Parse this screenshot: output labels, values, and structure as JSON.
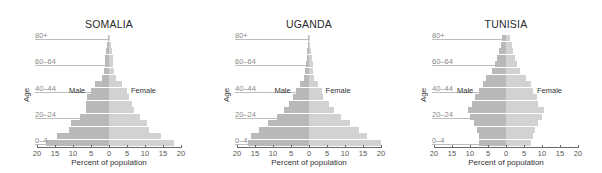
{
  "chart_data": [
    {
      "type": "bar",
      "subtype": "population-pyramid",
      "title": "SOMALIA",
      "xlabel": "Percent of population",
      "ylabel": "Age",
      "xlim": [
        -20,
        20
      ],
      "xticks": [
        20,
        15,
        10,
        5,
        0,
        5,
        10,
        15,
        20
      ],
      "categories": [
        "0-4",
        "5-9",
        "10-14",
        "15-19",
        "20-24",
        "25-29",
        "30-34",
        "35-39",
        "40-44",
        "45-49",
        "50-54",
        "55-59",
        "60-64",
        "65-69",
        "70-74",
        "75-79",
        "80+"
      ],
      "labeled_categories": [
        "0-4",
        "20-24",
        "40-44",
        "60-64",
        "80+"
      ],
      "series": [
        {
          "name": "Male",
          "values": [
            17.5,
            14.5,
            11,
            10.5,
            8,
            6.5,
            6.5,
            6,
            5,
            4,
            2,
            1.5,
            1,
            1,
            0.8,
            0.5,
            0.3
          ]
        },
        {
          "name": "Female",
          "values": [
            18,
            14.5,
            11,
            10.5,
            8.5,
            7,
            6.5,
            5.5,
            5,
            3.5,
            2,
            1.5,
            1.2,
            1,
            0.8,
            0.5,
            0.3
          ]
        }
      ],
      "legend": {
        "male_label": "Male",
        "female_label": "Female",
        "position": "inline at 40-44"
      }
    },
    {
      "type": "bar",
      "subtype": "population-pyramid",
      "title": "UGANDA",
      "xlabel": "Percent of population",
      "ylabel": "Age",
      "xlim": [
        -20,
        20
      ],
      "xticks": [
        20,
        15,
        10,
        5,
        0,
        5,
        10,
        15,
        20
      ],
      "categories": [
        "0-4",
        "5-9",
        "10-14",
        "15-19",
        "20-24",
        "25-29",
        "30-34",
        "35-39",
        "40-44",
        "45-49",
        "50-54",
        "55-59",
        "60-64",
        "65-69",
        "70-74",
        "75-79",
        "80+"
      ],
      "labeled_categories": [
        "0-4",
        "20-24",
        "40-44",
        "60-64",
        "80+"
      ],
      "series": [
        {
          "name": "Male",
          "values": [
            17,
            16,
            14,
            11.5,
            9,
            7,
            5.5,
            4.5,
            3.5,
            2.5,
            1.5,
            1,
            0.8,
            0.6,
            0.5,
            0.3,
            0.2
          ]
        },
        {
          "name": "Female",
          "values": [
            20,
            16,
            14,
            11.5,
            9,
            7,
            5.5,
            4,
            3.5,
            2.5,
            1.5,
            1.2,
            1,
            0.8,
            0.6,
            0.4,
            0.2
          ]
        }
      ],
      "legend": {
        "male_label": "Male",
        "female_label": "Female",
        "position": "inline at 40-44"
      }
    },
    {
      "type": "bar",
      "subtype": "population-pyramid",
      "title": "TUNISIA",
      "xlabel": "Percent of population",
      "ylabel": "Age",
      "xlim": [
        -20,
        20
      ],
      "xticks": [
        20,
        15,
        10,
        5,
        0,
        5,
        10,
        15,
        20
      ],
      "categories": [
        "0-4",
        "5-9",
        "10-14",
        "15-19",
        "20-24",
        "25-29",
        "30-34",
        "35-39",
        "40-44",
        "45-49",
        "50-54",
        "55-59",
        "60-64",
        "65-69",
        "70-74",
        "75-79",
        "80+"
      ],
      "labeled_categories": [
        "0-4",
        "20-24",
        "40-44",
        "60-64",
        "80+"
      ],
      "series": [
        {
          "name": "Male",
          "values": [
            7.5,
            7.5,
            8,
            9,
            10,
            10.5,
            9.5,
            8.5,
            7.5,
            6.5,
            5.5,
            4,
            3,
            2.5,
            2,
            1.5,
            1.2
          ]
        },
        {
          "name": "Female",
          "values": [
            7,
            7.5,
            8,
            9,
            10,
            10.5,
            9,
            8.5,
            7.5,
            7,
            5.5,
            4,
            3,
            2.5,
            2,
            1.8,
            1.2
          ]
        }
      ],
      "legend": {
        "male_label": "Male",
        "female_label": "Female",
        "position": "inline at 40-44"
      }
    }
  ],
  "colors": {
    "male": "#b9b9b9",
    "female": "#d2d2d2",
    "axis": "#6a6a6a",
    "age_guide": "#bdbdbd"
  }
}
